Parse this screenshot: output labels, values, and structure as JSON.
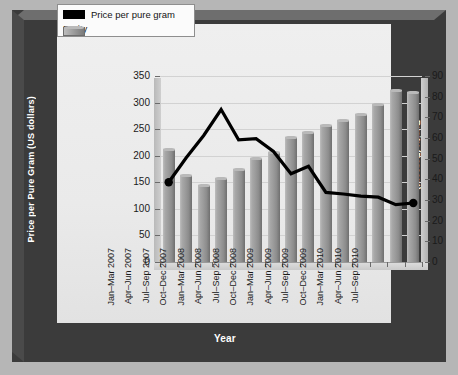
{
  "chart_data": {
    "type": "bar",
    "title": "",
    "subtitle": "",
    "xlabel": "Year",
    "ylabel": "Price per Pure Gram",
    "ylabel_sub": "(US dollars)",
    "y2label": "Purity",
    "y2label_sub": "(Percent)",
    "grid": true,
    "legend_position": "top-left",
    "ylim": [
      0,
      350
    ],
    "y2lim": [
      0,
      90
    ],
    "yticks": [
      0,
      50,
      100,
      150,
      200,
      250,
      300,
      350
    ],
    "y2ticks": [
      0,
      10,
      20,
      30,
      40,
      50,
      60,
      70,
      80,
      90
    ],
    "categories": [
      "Jan–Mar 2007",
      "Apr–Jun 2007",
      "Jul–Sep 2007",
      "Oct–Dec 2007",
      "Jan–Mar 2008",
      "Apr–Jun 2008",
      "Jul–Sep 2008",
      "Oct–Dec 2008",
      "Jan–Mar 2009",
      "Apr–Jun 2009",
      "Jul–Sep 2009",
      "Oct–Dec 2009",
      "Jan–Mar 2010",
      "Apr–Jun 2010",
      "Jul–Sep 2010"
    ],
    "series": [
      {
        "name": "Purity",
        "type": "bar",
        "axis": "right",
        "unit": "percent",
        "color": "#9b9b9b",
        "values": [
          54.5,
          42.0,
          37.5,
          40.5,
          45.0,
          50.5,
          53.0,
          60.5,
          63.0,
          66.5,
          68.5,
          71.5,
          76.5,
          83.0,
          82.5
        ]
      },
      {
        "name": "Price per pure gram",
        "type": "line",
        "axis": "left",
        "unit": "US dollars",
        "color": "#000000",
        "values": [
          150,
          196,
          238,
          287,
          230,
          232,
          208,
          166,
          180,
          131,
          128,
          124,
          122,
          108,
          111
        ]
      }
    ]
  },
  "legend": {
    "items": [
      {
        "label": "Price per pure gram",
        "swatch": "line"
      },
      {
        "label": "Purity",
        "swatch": "bar"
      }
    ]
  },
  "axes": {
    "left_title": "Price per Pure Gram",
    "left_subtitle": "(US dollars)",
    "right_title": "Purity",
    "right_subtitle": "(Percent)",
    "bottom_title": "Year"
  },
  "colors": {
    "background": "#b6b6b6",
    "frame": "#3b3b3b",
    "panel": "#ececec",
    "bar": "#9b9b9b",
    "line": "#000000",
    "grid": "#d2d2d2",
    "text": "#1a1a1a",
    "frame_text": "#ffffff"
  }
}
